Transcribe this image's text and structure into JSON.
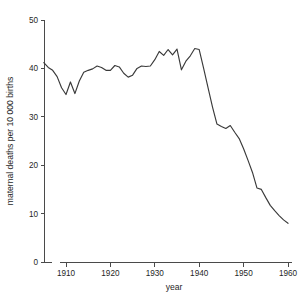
{
  "chart_data": {
    "type": "line",
    "title": "",
    "xlabel": "year",
    "ylabel": "maternal deaths per 10 000 births",
    "xlim": [
      1905,
      1960
    ],
    "ylim": [
      0,
      50
    ],
    "grid": false,
    "legend": false,
    "line_color": "#3a3a3a",
    "axis_color": "#4a4a4a",
    "xticks": [
      1910,
      1920,
      1930,
      1940,
      1950,
      1960
    ],
    "xtick_labels": [
      "1910",
      "1920",
      "1930",
      "1940",
      "1950",
      "1960"
    ],
    "yticks": [
      0,
      10,
      20,
      30,
      40,
      50
    ],
    "ytick_labels": [
      "0",
      "10",
      "20",
      "30",
      "40",
      "50"
    ],
    "series": [
      {
        "name": "maternal deaths per 10 000 births",
        "x": [
          1905,
          1906,
          1907,
          1908,
          1909,
          1910,
          1911,
          1912,
          1913,
          1914,
          1915,
          1916,
          1917,
          1918,
          1919,
          1920,
          1921,
          1922,
          1923,
          1924,
          1925,
          1926,
          1927,
          1928,
          1929,
          1930,
          1931,
          1932,
          1933,
          1934,
          1935,
          1936,
          1937,
          1938,
          1939,
          1940,
          1941,
          1942,
          1943,
          1944,
          1945,
          1946,
          1947,
          1948,
          1949,
          1950,
          1951,
          1952,
          1953,
          1954,
          1955,
          1956,
          1957,
          1958,
          1959,
          1960
        ],
        "values": [
          41.2,
          40.2,
          39.6,
          38.3,
          36.0,
          34.6,
          37.2,
          34.8,
          37.4,
          39.2,
          39.6,
          39.9,
          40.5,
          40.2,
          39.6,
          39.6,
          40.6,
          40.3,
          39.0,
          38.2,
          38.6,
          40.0,
          40.5,
          40.4,
          40.5,
          41.8,
          43.5,
          42.7,
          43.9,
          42.8,
          44.0,
          39.7,
          41.5,
          42.6,
          44.1,
          43.9,
          40.0,
          36.0,
          32.0,
          28.5,
          28.0,
          27.6,
          28.2,
          26.8,
          25.5,
          23.4,
          21.0,
          18.5,
          15.3,
          15.0,
          13.3,
          11.7,
          10.6,
          9.6,
          8.7,
          8.0
        ]
      }
    ],
    "annotations": []
  },
  "axis": {
    "y_label": "maternal deaths per 10 000 births",
    "x_label": "year"
  },
  "figure": {
    "background": "#ffffff"
  }
}
